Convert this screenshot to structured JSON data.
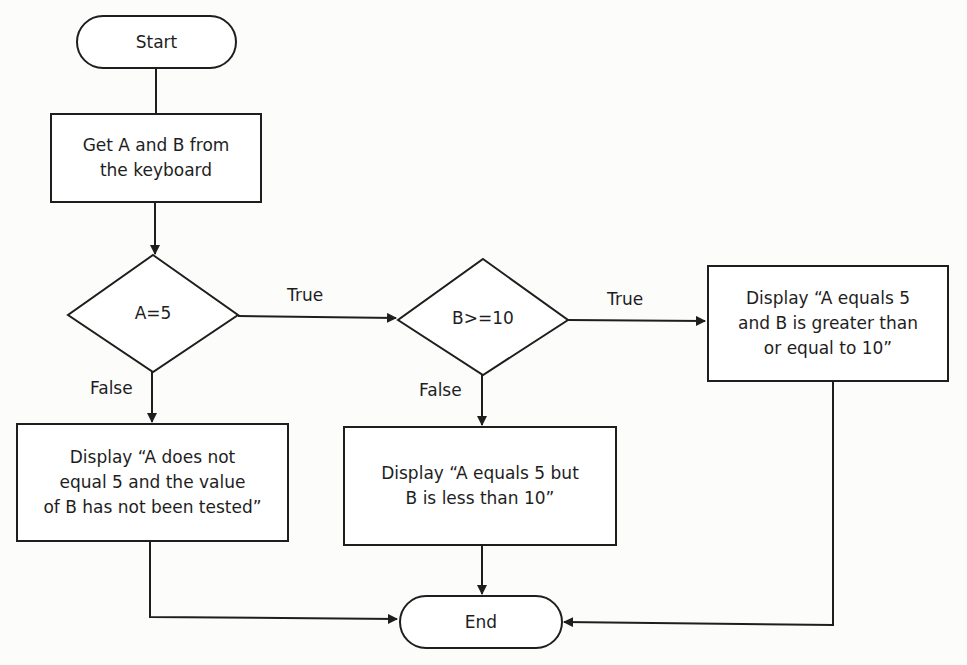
{
  "diagram": {
    "type": "flowchart",
    "nodes": {
      "start": {
        "label": "Start",
        "shape": "terminal"
      },
      "input": {
        "label_line1": "Get A and B from",
        "label_line2": "the keyboard",
        "shape": "process"
      },
      "decision_a": {
        "label": "A=5",
        "shape": "decision"
      },
      "decision_b": {
        "label": "B>=10",
        "shape": "decision"
      },
      "display_both": {
        "label_line1": "Display “A equals 5",
        "label_line2": "and B is greater than",
        "label_line3": "or equal to 10”",
        "shape": "process"
      },
      "display_a_not": {
        "label_line1": "Display “A does not",
        "label_line2": "equal 5 and the value",
        "label_line3": "of B has not been tested”",
        "shape": "process"
      },
      "display_b_less": {
        "label_line1": "Display “A equals 5 but",
        "label_line2": "B is less than 10”",
        "shape": "process"
      },
      "end": {
        "label": "End",
        "shape": "terminal"
      }
    },
    "edges": {
      "a_true": "True",
      "a_false": "False",
      "b_true": "True",
      "b_false": "False"
    },
    "stroke_color": "#1e1e1e",
    "background_color": "#fcfcfb"
  }
}
